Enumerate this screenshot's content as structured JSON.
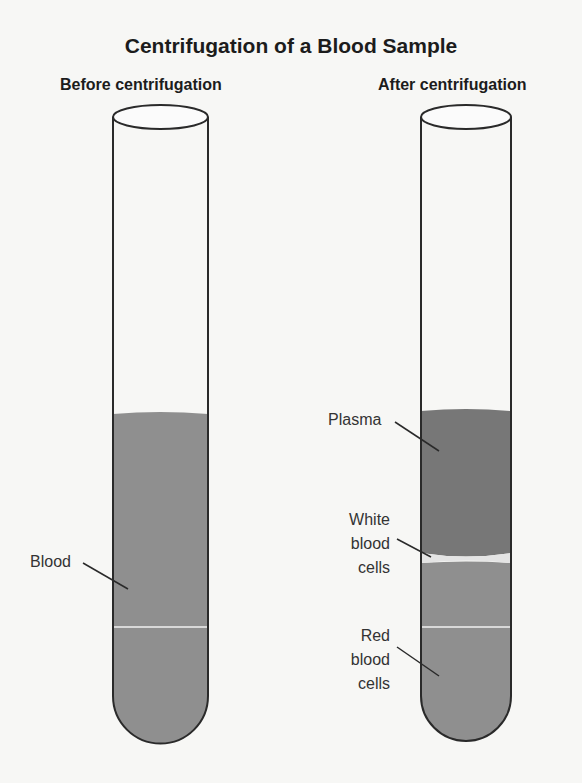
{
  "title": "Centrifugation of a Blood Sample",
  "panels": [
    {
      "heading": "Before centrifugation",
      "labels": [
        "Blood"
      ]
    },
    {
      "heading": "After centrifugation",
      "labels": [
        "Plasma",
        "White blood cells",
        "Red blood cells"
      ]
    }
  ],
  "labels": {
    "blood": "Blood",
    "plasma": "Plasma",
    "wbc_line1": "White",
    "wbc_line2": "blood",
    "wbc_line3": "cells",
    "rbc_line1": "Red",
    "rbc_line2": "blood",
    "rbc_line3": "cells"
  },
  "colors": {
    "blood": "#8f8f8f",
    "plasma": "#777777",
    "red_cells": "#8f8f8f",
    "white_cells": "#e4e4e4",
    "outline": "#2a2a2a"
  }
}
